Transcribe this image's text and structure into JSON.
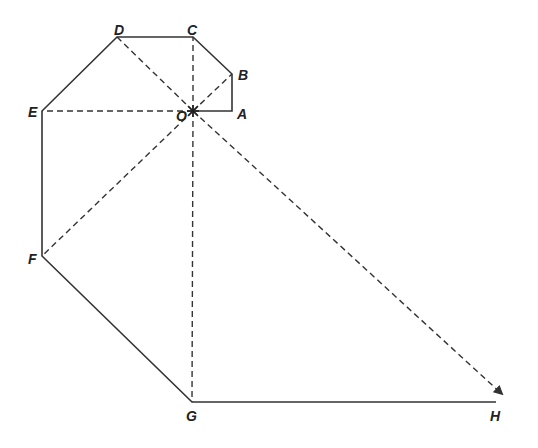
{
  "diagram": {
    "type": "geometric-path-with-center-rays",
    "points": [
      {
        "name": "A",
        "x": 232,
        "y": 111,
        "lx": 237,
        "ly": 119
      },
      {
        "name": "B",
        "x": 232,
        "y": 74,
        "lx": 238,
        "ly": 80
      },
      {
        "name": "C",
        "x": 193,
        "y": 37,
        "lx": 187,
        "ly": 35
      },
      {
        "name": "D",
        "x": 117,
        "y": 37,
        "lx": 114,
        "ly": 35
      },
      {
        "name": "E",
        "x": 42,
        "y": 111,
        "lx": 28,
        "ly": 117
      },
      {
        "name": "F",
        "x": 42,
        "y": 256,
        "lx": 28,
        "ly": 264
      },
      {
        "name": "G",
        "x": 192,
        "y": 402,
        "lx": 186,
        "ly": 421
      },
      {
        "name": "H",
        "x": 496,
        "y": 402,
        "lx": 490,
        "ly": 421
      },
      {
        "name": "O",
        "x": 193,
        "y": 111,
        "lx": 176,
        "ly": 121
      }
    ],
    "solid_path": [
      "O",
      "A",
      "B",
      "C",
      "D",
      "E",
      "F",
      "G",
      "H"
    ],
    "dashed_rays_from_O": [
      "B",
      "C",
      "D",
      "E",
      "F",
      "G",
      "H"
    ],
    "arrow_at": "H",
    "stroke_color": "#333333",
    "label_color": "#222222"
  }
}
